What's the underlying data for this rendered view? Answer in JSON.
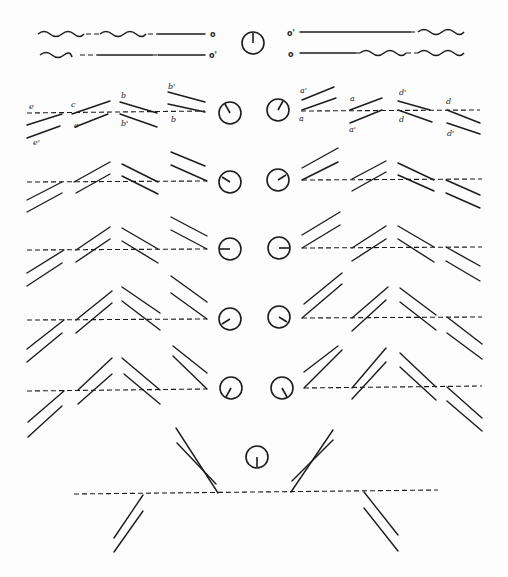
{
  "figure": {
    "top_labels": {
      "left_upper": "o",
      "left_lower": "o'",
      "right_upper": "o'",
      "right_lower": "o"
    },
    "row1_labels": {
      "left": [
        "e",
        "e'",
        "c",
        "c",
        "b",
        "b'",
        "b'",
        "b"
      ],
      "right": [
        "a'",
        "a",
        "a",
        "a'",
        "d'",
        "d",
        "d",
        "d'"
      ]
    },
    "dials": [
      {
        "row": 0,
        "side": "center",
        "hand_angle_deg": 0
      },
      {
        "row": 1,
        "side": "left",
        "hand_angle_deg": -30
      },
      {
        "row": 1,
        "side": "right",
        "hand_angle_deg": 30
      },
      {
        "row": 2,
        "side": "left",
        "hand_angle_deg": -60
      },
      {
        "row": 2,
        "side": "right",
        "hand_angle_deg": 60
      },
      {
        "row": 3,
        "side": "left",
        "hand_angle_deg": -90
      },
      {
        "row": 3,
        "side": "right",
        "hand_angle_deg": 90
      },
      {
        "row": 4,
        "side": "left",
        "hand_angle_deg": -120
      },
      {
        "row": 4,
        "side": "right",
        "hand_angle_deg": 120
      },
      {
        "row": 5,
        "side": "left",
        "hand_angle_deg": -150
      },
      {
        "row": 5,
        "side": "right",
        "hand_angle_deg": 150
      },
      {
        "row": 6,
        "side": "center",
        "hand_angle_deg": 180
      }
    ]
  }
}
